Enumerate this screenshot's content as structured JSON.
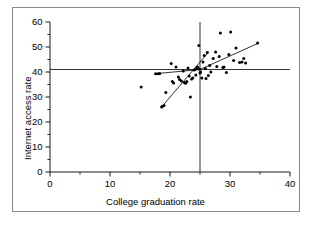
{
  "chart_data": {
    "type": "scatter",
    "title": "",
    "xlabel": "College graduation rate",
    "ylabel": "Internet access rate",
    "xlim": [
      0,
      40
    ],
    "ylim": [
      0,
      60
    ],
    "xticks": [
      0,
      10,
      20,
      30,
      40
    ],
    "xticklabels": [
      "0",
      "10",
      "20",
      "30",
      "40"
    ],
    "xminorticks": [
      5,
      15,
      25,
      35
    ],
    "yticks": [
      0,
      10,
      20,
      30,
      40,
      50,
      60
    ],
    "yticklabels": [
      "0",
      "10",
      "20",
      "30",
      "40",
      "50",
      "60"
    ],
    "yminorticks": [
      5,
      15,
      25,
      35,
      45,
      55
    ],
    "grid": false,
    "legend": null,
    "marker": "filled-circle",
    "marker_color": "#000000",
    "line_color": "#000000",
    "points": [
      [
        15.2,
        34.0
      ],
      [
        17.6,
        39.3
      ],
      [
        18.0,
        39.3
      ],
      [
        18.3,
        39.4
      ],
      [
        18.6,
        26.0
      ],
      [
        18.7,
        26.2
      ],
      [
        19.0,
        26.6
      ],
      [
        19.3,
        31.8
      ],
      [
        20.2,
        43.4
      ],
      [
        20.4,
        36.2
      ],
      [
        20.6,
        35.6
      ],
      [
        21.0,
        42.0
      ],
      [
        21.4,
        38.0
      ],
      [
        21.6,
        37.0
      ],
      [
        21.9,
        36.4
      ],
      [
        22.2,
        40.4
      ],
      [
        22.4,
        35.8
      ],
      [
        22.6,
        35.5
      ],
      [
        22.8,
        36.2
      ],
      [
        23.0,
        41.6
      ],
      [
        23.2,
        38.4
      ],
      [
        23.4,
        30.0
      ],
      [
        23.6,
        37.2
      ],
      [
        23.8,
        37.6
      ],
      [
        24.0,
        40.8
      ],
      [
        24.2,
        41.0
      ],
      [
        24.3,
        38.8
      ],
      [
        24.5,
        41.8
      ],
      [
        24.6,
        42.0
      ],
      [
        24.8,
        50.6
      ],
      [
        24.9,
        41.2
      ],
      [
        25.0,
        39.6
      ],
      [
        25.1,
        40.0
      ],
      [
        25.3,
        37.6
      ],
      [
        25.5,
        44.0
      ],
      [
        25.7,
        46.6
      ],
      [
        25.9,
        41.4
      ],
      [
        26.0,
        37.4
      ],
      [
        26.2,
        47.8
      ],
      [
        26.4,
        38.6
      ],
      [
        26.6,
        42.6
      ],
      [
        26.8,
        40.0
      ],
      [
        27.2,
        45.4
      ],
      [
        27.6,
        48.0
      ],
      [
        27.8,
        42.2
      ],
      [
        28.2,
        46.2
      ],
      [
        28.4,
        55.6
      ],
      [
        28.8,
        41.8
      ],
      [
        29.0,
        42.0
      ],
      [
        29.4,
        39.8
      ],
      [
        29.8,
        47.0
      ],
      [
        30.1,
        56.0
      ],
      [
        30.6,
        44.6
      ],
      [
        31.0,
        49.6
      ],
      [
        31.6,
        43.8
      ],
      [
        32.0,
        44.0
      ],
      [
        32.3,
        45.4
      ],
      [
        32.6,
        43.6
      ],
      [
        34.6,
        51.6
      ]
    ],
    "reference_lines": [
      {
        "name": "horizontal-mean-line",
        "orientation": "horizontal",
        "value": 41.0,
        "x_from": 0,
        "x_to": 40
      },
      {
        "name": "vertical-mean-line",
        "orientation": "vertical",
        "value": 25.0,
        "y_from": 0,
        "y_to": 60
      }
    ],
    "fit_lines": [
      {
        "name": "steep-fit-line",
        "x_from": 18.6,
        "y_from": 26.0,
        "x_to": 26.5,
        "y_to": 48.2
      },
      {
        "name": "shallow-left-fit-line",
        "x_from": 17.5,
        "y_from": 39.3,
        "x_to": 25.0,
        "y_to": 41.0
      },
      {
        "name": "right-fit-line",
        "x_from": 25.0,
        "y_from": 41.0,
        "x_to": 34.7,
        "y_to": 51.5
      }
    ],
    "mean_point": [
      25.0,
      41.0
    ]
  }
}
